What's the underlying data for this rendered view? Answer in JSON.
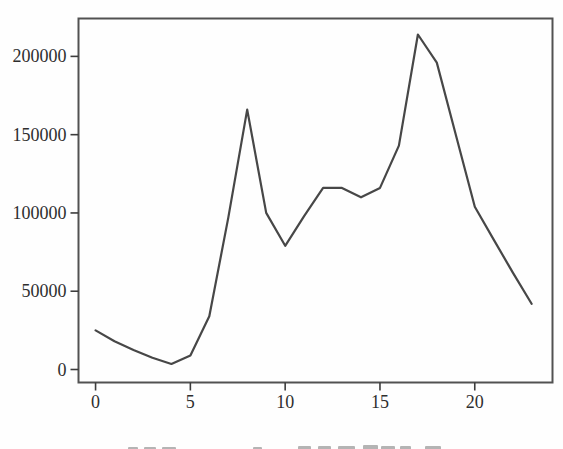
{
  "figure": {
    "background": "#fefefe",
    "frame_color": "#525252",
    "line_color": "#474747",
    "tick_color": "#3c3c3c",
    "label_color": "#2e2e2e",
    "label_font_size": 18
  },
  "chart_data": {
    "type": "line",
    "title": "",
    "xlabel": "",
    "ylabel": "",
    "legend": "none",
    "grid": false,
    "x": [
      0,
      1,
      2,
      3,
      4,
      5,
      6,
      7,
      8,
      9,
      10,
      11,
      12,
      13,
      14,
      15,
      16,
      17,
      18,
      19,
      20,
      21,
      22,
      23
    ],
    "values": [
      25000,
      18000,
      12500,
      7500,
      3500,
      9000,
      34000,
      97000,
      166000,
      100000,
      79000,
      98000,
      116000,
      116000,
      110000,
      116000,
      143000,
      214000,
      196000,
      150000,
      104000,
      83000,
      62000,
      42000
    ],
    "x_ticks": [
      0,
      5,
      10,
      15,
      20
    ],
    "x_tick_labels": [
      "0",
      "5",
      "10",
      "15",
      "20"
    ],
    "y_ticks": [
      0,
      50000,
      100000,
      150000,
      200000
    ],
    "y_tick_labels": [
      "0",
      "50000",
      "100000",
      "150000",
      "200000"
    ],
    "xlim": [
      -0.9,
      24.1
    ],
    "ylim": [
      -8300,
      224200
    ]
  },
  "caption": {
    "fragments": [
      {
        "x": 128,
        "w": 10,
        "h": 3
      },
      {
        "x": 144,
        "w": 12,
        "h": 3
      },
      {
        "x": 162,
        "w": 14,
        "h": 3
      },
      {
        "x": 253,
        "w": 9,
        "h": 3
      },
      {
        "x": 298,
        "w": 13,
        "h": 4
      },
      {
        "x": 318,
        "w": 13,
        "h": 4
      },
      {
        "x": 338,
        "w": 17,
        "h": 4
      },
      {
        "x": 363,
        "w": 15,
        "h": 5
      },
      {
        "x": 381,
        "w": 14,
        "h": 4
      },
      {
        "x": 400,
        "w": 11,
        "h": 4
      },
      {
        "x": 425,
        "w": 16,
        "h": 4
      }
    ]
  }
}
